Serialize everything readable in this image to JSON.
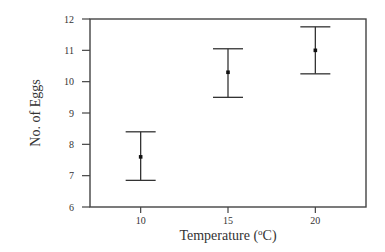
{
  "chart_data": {
    "type": "errorbar",
    "title": "",
    "xlabel": "Temperature (°C)",
    "xlabel_parts": {
      "prefix": "Temperature (",
      "superscript": "o",
      "suffix": "C)"
    },
    "ylabel": "No. of Eggs",
    "categories": [
      "10",
      "15",
      "20"
    ],
    "x": [
      10,
      15,
      20
    ],
    "series": [
      {
        "name": "No. of Eggs",
        "mean": [
          7.6,
          10.3,
          11.0
        ],
        "lower": [
          6.85,
          9.5,
          10.25
        ],
        "upper": [
          8.4,
          11.05,
          11.75
        ]
      }
    ],
    "xlim": [
      7.1,
      22.9
    ],
    "ylim": [
      6,
      12
    ],
    "yticks": [
      6,
      7,
      8,
      9,
      10,
      11,
      12
    ],
    "xticks": [
      10,
      15,
      20
    ],
    "grid": false,
    "legend": "none",
    "colors": {
      "line": "#333333",
      "frame": "#444444",
      "background": "#ffffff"
    }
  }
}
